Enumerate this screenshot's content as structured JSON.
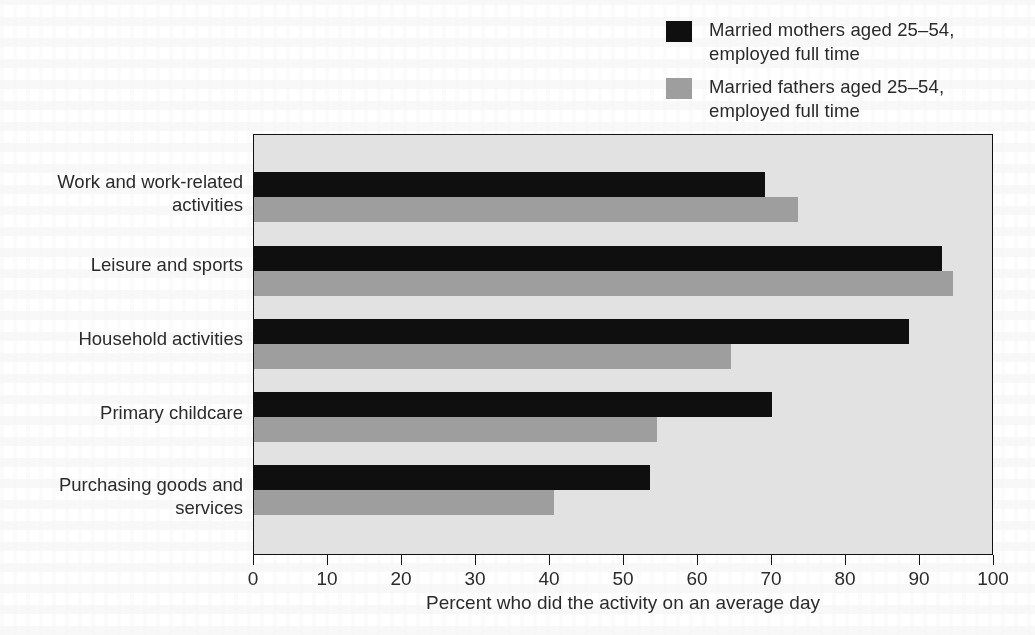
{
  "legend": {
    "items": [
      {
        "label": "Married mothers aged 25–54,\nemployed full time",
        "color": "#100f0f",
        "swatch_name": "legend-swatch-mothers"
      },
      {
        "label": "Married fathers aged 25–54,\nemployed full time",
        "color": "#9e9e9e",
        "swatch_name": "legend-swatch-fathers"
      }
    ]
  },
  "axis": {
    "x_title": "Percent who did the activity on an average day",
    "x_ticks": [
      "0",
      "10",
      "20",
      "30",
      "40",
      "50",
      "60",
      "70",
      "80",
      "90",
      "100"
    ],
    "x_min": 0,
    "x_max": 100
  },
  "categories": [
    "Work and work-related\nactivities",
    "Leisure and sports",
    "Household activities",
    "Primary childcare",
    "Purchasing goods and\nservices"
  ],
  "colors": {
    "series_1": "#100f0f",
    "series_2": "#9e9e9e",
    "plot_background": "#e2e2e2",
    "frame": "#111111",
    "text": "#2b2b2b",
    "page_background": "#ffffff"
  },
  "chart_data": {
    "type": "bar",
    "orientation": "horizontal",
    "title": "",
    "subtitle": "",
    "xlabel": "Percent who did the activity on an average day",
    "ylabel": "",
    "xlim": [
      0,
      100
    ],
    "xticks": [
      0,
      10,
      20,
      30,
      40,
      50,
      60,
      70,
      80,
      90,
      100
    ],
    "grid": false,
    "legend_position": "top-right",
    "categories": [
      "Work and work-related activities",
      "Leisure and sports",
      "Household activities",
      "Primary childcare",
      "Purchasing goods and services"
    ],
    "series": [
      {
        "name": "Married mothers aged 25–54, employed full time",
        "color": "#100f0f",
        "values": [
          69,
          93,
          88.5,
          70,
          53.5
        ]
      },
      {
        "name": "Married fathers aged 25–54, employed full time",
        "color": "#9e9e9e",
        "values": [
          73.5,
          94.5,
          64.5,
          54.5,
          40.5
        ]
      }
    ]
  }
}
